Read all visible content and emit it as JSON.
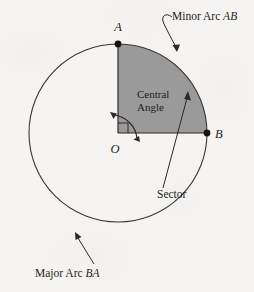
{
  "figure": {
    "background_color": "#f5f4f2",
    "stroke_color": "#3a3633",
    "sector_fill_color": "#9a9a9a",
    "point_color": "#161210"
  },
  "points": {
    "a_label": "A",
    "b_label": "B",
    "o_label": "O"
  },
  "annotations": {
    "minor_arc_prefix": "Minor Arc ",
    "minor_arc_points": "AB",
    "central_angle_line1": "Central",
    "central_angle_line2": "Angle",
    "sector": "Sector",
    "major_arc_prefix": "Major Arc ",
    "major_arc_points": "BA"
  },
  "geometry": {
    "center_x": 118,
    "center_y": 133,
    "radius": 89,
    "sector_start_angle_deg": 90,
    "sector_end_angle_deg": 0,
    "central_angle_deg": 90
  }
}
